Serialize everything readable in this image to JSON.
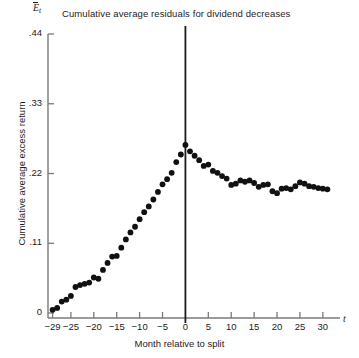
{
  "chart_data": {
    "type": "scatter",
    "title": "Cumulative average residuals for dividend decreases",
    "xlabel": "Month relative to split",
    "ylabel": "Cumulative average excess return",
    "x_axis_symbol": "t",
    "y_axis_symbol": "E",
    "y_axis_symbol_sub": "t",
    "xlim": [
      -30,
      32
    ],
    "ylim": [
      0,
      0.44
    ],
    "xticks": [
      -29,
      -25,
      -20,
      -15,
      -10,
      -5,
      0,
      5,
      10,
      15,
      20,
      25,
      30
    ],
    "xtick_labels": [
      "−29",
      "−25",
      "−20",
      "−15",
      "−10",
      "−5",
      "0",
      "5",
      "10",
      "15",
      "20",
      "25",
      "30"
    ],
    "yticks": [
      0,
      0.11,
      0.22,
      0.33,
      0.44
    ],
    "ytick_labels": [
      "0",
      ".11",
      ".22",
      ".33",
      ".44"
    ],
    "grid": false,
    "legend": null,
    "marker": "filled-circle",
    "marker_color": "#111111",
    "annotations": [
      {
        "name": "event-line",
        "type": "vertical-line",
        "x": 0,
        "label": ""
      }
    ],
    "x": [
      -29,
      -28,
      -27,
      -26,
      -25,
      -24,
      -23,
      -22,
      -21,
      -20,
      -19,
      -18,
      -17,
      -16,
      -15,
      -14,
      -13,
      -12,
      -11,
      -10,
      -9,
      -8,
      -7,
      -6,
      -5,
      -4,
      -3,
      -2,
      -1,
      0,
      1,
      2,
      3,
      4,
      5,
      6,
      7,
      8,
      9,
      10,
      11,
      12,
      13,
      14,
      15,
      16,
      17,
      18,
      19,
      20,
      21,
      22,
      23,
      24,
      25,
      26,
      27,
      28,
      29,
      30,
      31
    ],
    "values": [
      0.005,
      0.008,
      0.018,
      0.021,
      0.027,
      0.041,
      0.044,
      0.046,
      0.048,
      0.056,
      0.054,
      0.068,
      0.079,
      0.089,
      0.09,
      0.103,
      0.116,
      0.127,
      0.136,
      0.148,
      0.159,
      0.168,
      0.179,
      0.191,
      0.203,
      0.211,
      0.221,
      0.238,
      0.25,
      0.265,
      0.255,
      0.248,
      0.241,
      0.232,
      0.234,
      0.224,
      0.221,
      0.216,
      0.212,
      0.202,
      0.204,
      0.209,
      0.207,
      0.209,
      0.205,
      0.199,
      0.202,
      0.203,
      0.192,
      0.189,
      0.196,
      0.197,
      0.195,
      0.2,
      0.206,
      0.204,
      0.2,
      0.199,
      0.197,
      0.196,
      0.195
    ]
  }
}
